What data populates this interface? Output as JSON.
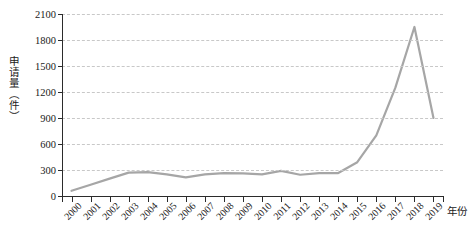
{
  "chart_data": {
    "type": "line",
    "title": "",
    "xlabel": "年份",
    "ylabel": "申请量（件）",
    "categories": [
      "2000",
      "2001",
      "2002",
      "2003",
      "2004",
      "2005",
      "2006",
      "2007",
      "2008",
      "2009",
      "2010",
      "2011",
      "2012",
      "2013",
      "2014",
      "2015",
      "2016",
      "2017",
      "2018",
      "2019"
    ],
    "values": [
      60,
      130,
      200,
      270,
      275,
      250,
      215,
      250,
      265,
      260,
      250,
      290,
      245,
      265,
      265,
      390,
      700,
      1250,
      1950,
      900
    ],
    "series": [
      {
        "name": "申请量",
        "color": "#a6a6a6",
        "values": [
          60,
          130,
          200,
          270,
          275,
          250,
          215,
          250,
          265,
          260,
          250,
          290,
          245,
          265,
          265,
          390,
          700,
          1250,
          1950,
          900
        ]
      }
    ],
    "ylim": [
      0,
      2100
    ],
    "yticks": [
      0,
      300,
      600,
      900,
      1200,
      1500,
      1800,
      2100
    ],
    "ytick_labels": [
      "0",
      "300",
      "600",
      "900",
      "1200",
      "1500",
      "1800",
      "2100"
    ],
    "grid": "horizontal-dashed",
    "legend": "none",
    "colors": {
      "line": "#a6a6a6",
      "axis": "#2b2b2b",
      "grid": "#c8c8c8",
      "text": "#1a1a1a",
      "background": "#ffffff"
    }
  }
}
